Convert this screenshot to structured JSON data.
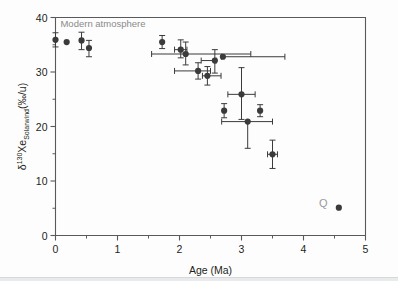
{
  "figure": {
    "background_color": "#fdfdfd",
    "frame_color": "#58595b",
    "point_color": "#3b3b3b",
    "annotation_color": "#8a8a8a"
  },
  "chart_data": {
    "type": "scatter",
    "title": "",
    "xlabel": "Age (Ma)",
    "ylabel": "δ¹³⁰Xe_Solarwind(‰/u)",
    "ylabel_base": "Xe",
    "ylabel_super": "130",
    "ylabel_delta": "δ",
    "ylabel_sub": "Solarwind",
    "ylabel_units": "(‰/u)",
    "xlim": [
      0,
      5
    ],
    "ylim": [
      0,
      40
    ],
    "xticks": [
      0,
      1,
      2,
      3,
      4,
      5
    ],
    "xtick_labels": [
      "0",
      "1",
      "2",
      "3",
      "4",
      "5"
    ],
    "xminor_ticks": [
      0.5,
      1.5,
      2.5,
      3.5,
      4.5
    ],
    "yticks": [
      0,
      10,
      20,
      30,
      40
    ],
    "ytick_labels": [
      "0",
      "10",
      "20",
      "30",
      "40"
    ],
    "yminor_ticks": [
      5,
      15,
      25,
      35
    ],
    "grid": false,
    "legend": "none",
    "annotations": [
      {
        "text": "Modern atmosphere",
        "x": 0.08,
        "y": 38.2,
        "color": "#8a8a8a"
      },
      {
        "text": "Q",
        "x": 4.25,
        "y": 5.2,
        "color": "#9a9a9a"
      }
    ],
    "points": [
      {
        "x": 0.0,
        "y": 35.9,
        "xerr": [
          0,
          0
        ],
        "yerr": [
          1.3,
          1.3
        ]
      },
      {
        "x": 0.18,
        "y": 35.5,
        "xerr": [
          0,
          0
        ],
        "yerr": [
          0,
          0
        ]
      },
      {
        "x": 0.42,
        "y": 35.8,
        "xerr": [
          0,
          0
        ],
        "yerr": [
          1.7,
          1.5
        ]
      },
      {
        "x": 0.54,
        "y": 34.4,
        "xerr": [
          0,
          0
        ],
        "yerr": [
          1.6,
          1.4
        ]
      },
      {
        "x": 1.72,
        "y": 35.5,
        "xerr": [
          0,
          0
        ],
        "yerr": [
          1.2,
          1.2
        ]
      },
      {
        "x": 2.02,
        "y": 34.1,
        "xerr": [
          0.1,
          0.1
        ],
        "yerr": [
          1.5,
          1.8
        ]
      },
      {
        "x": 2.1,
        "y": 33.3,
        "xerr": [
          0.55,
          1.05
        ],
        "yerr": [
          2.0,
          2.2
        ]
      },
      {
        "x": 2.3,
        "y": 30.2,
        "xerr": [
          0.38,
          0.2
        ],
        "yerr": [
          1.5,
          1.5
        ]
      },
      {
        "x": 2.45,
        "y": 29.3,
        "xerr": [
          0.08,
          0.22
        ],
        "yerr": [
          1.7,
          1.7
        ]
      },
      {
        "x": 2.57,
        "y": 32.1,
        "xerr": [
          0.22,
          0.02
        ],
        "yerr": [
          2.3,
          2.0
        ]
      },
      {
        "x": 2.7,
        "y": 32.8,
        "xerr": [
          0.02,
          1.0
        ],
        "yerr": [
          0,
          0
        ]
      },
      {
        "x": 2.72,
        "y": 22.9,
        "xerr": [
          0,
          0
        ],
        "yerr": [
          1.3,
          1.3
        ]
      },
      {
        "x": 3.0,
        "y": 25.9,
        "xerr": [
          0.22,
          0.22
        ],
        "yerr": [
          4.6,
          4.9
        ]
      },
      {
        "x": 3.1,
        "y": 20.9,
        "xerr": [
          0.42,
          0.4
        ],
        "yerr": [
          4.9,
          0
        ]
      },
      {
        "x": 3.3,
        "y": 22.9,
        "xerr": [
          0,
          0
        ],
        "yerr": [
          1.1,
          1.1
        ]
      },
      {
        "x": 3.5,
        "y": 14.9,
        "xerr": [
          0.08,
          0.08
        ],
        "yerr": [
          2.6,
          2.6
        ]
      },
      {
        "x": 4.57,
        "y": 5.1,
        "xerr": [
          0,
          0
        ],
        "yerr": [
          0,
          0
        ]
      }
    ]
  }
}
